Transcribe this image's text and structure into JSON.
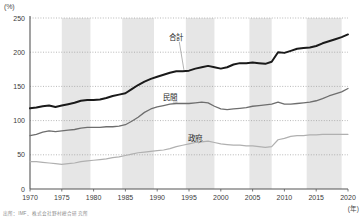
{
  "figure": {
    "y_unit_label": "(%)",
    "x_unit_label": "(年)",
    "source_note": "出所：IMF、株式会社野村総合研究所"
  },
  "chart_data": {
    "type": "line",
    "title": "",
    "subtitle": "",
    "xlabel": "(年)",
    "ylabel": "(%)",
    "xlim": [
      1970,
      2020
    ],
    "ylim": [
      0,
      250
    ],
    "yticks": [
      0,
      50,
      100,
      150,
      200,
      250
    ],
    "ytick_labels": [
      "0",
      "50",
      "100",
      "150",
      "200",
      "250"
    ],
    "xticks": [
      1970,
      1975,
      1980,
      1985,
      1990,
      1995,
      2000,
      2005,
      2010,
      2015,
      2020
    ],
    "xtick_labels": [
      "1970",
      "1975",
      "1980",
      "1985",
      "1990",
      "1995",
      "2000",
      "2005",
      "2010",
      "2015",
      "2020"
    ],
    "grid": "horizontal-dotted",
    "legend_position": "inline-annotations",
    "shaded_bands": [
      {
        "start": 1975.0,
        "end": 1979.5
      },
      {
        "start": 1984.5,
        "end": 1989.5
      },
      {
        "start": 1994.5,
        "end": 1999.0
      },
      {
        "start": 2004.5,
        "end": 2008.0
      },
      {
        "start": 2013.5,
        "end": 2019.0
      }
    ],
    "x": [
      1970,
      1971,
      1972,
      1973,
      1974,
      1975,
      1976,
      1977,
      1978,
      1979,
      1980,
      1981,
      1982,
      1983,
      1984,
      1985,
      1986,
      1987,
      1988,
      1989,
      1990,
      1991,
      1992,
      1993,
      1994,
      1995,
      1996,
      1997,
      1998,
      1999,
      2000,
      2001,
      2002,
      2003,
      2004,
      2005,
      2006,
      2007,
      2008,
      2009,
      2010,
      2011,
      2012,
      2013,
      2014,
      2015,
      2016,
      2017,
      2018,
      2019,
      2020
    ],
    "series": [
      {
        "name": "合計",
        "label": "合計",
        "color": "#1a1a1a",
        "width": 2.0,
        "label_x": 1993,
        "label_y": 218,
        "values": [
          118,
          119,
          121,
          122,
          120,
          122,
          124,
          126,
          129,
          130,
          130,
          131,
          133,
          136,
          138,
          140,
          146,
          152,
          157,
          161,
          164,
          167,
          170,
          172,
          172,
          173,
          176,
          178,
          180,
          178,
          176,
          178,
          182,
          184,
          184,
          185,
          184,
          183,
          186,
          200,
          199,
          202,
          205,
          206,
          207,
          209,
          213,
          216,
          219,
          222,
          226
        ]
      },
      {
        "name": "民間",
        "label": "民間",
        "color": "#6e6e6e",
        "width": 1.3,
        "label_x": 1992,
        "label_y": 130,
        "values": [
          78,
          80,
          83,
          85,
          84,
          85,
          86,
          87,
          89,
          90,
          90,
          90,
          91,
          91,
          92,
          94,
          99,
          105,
          112,
          117,
          120,
          122,
          124,
          125,
          125,
          125,
          126,
          127,
          126,
          121,
          117,
          116,
          117,
          118,
          119,
          121,
          122,
          123,
          124,
          127,
          124,
          124,
          125,
          126,
          127,
          129,
          132,
          136,
          139,
          142,
          147
        ]
      },
      {
        "name": "政府",
        "label": "政府",
        "color": "#b0b0b0",
        "width": 1.2,
        "label_x": 1996,
        "label_y": 70,
        "values": [
          40,
          40,
          39,
          38,
          37,
          36,
          37,
          38,
          40,
          41,
          42,
          43,
          44,
          46,
          47,
          49,
          51,
          53,
          54,
          55,
          56,
          57,
          59,
          62,
          64,
          66,
          68,
          69,
          70,
          68,
          66,
          65,
          64,
          64,
          63,
          63,
          62,
          61,
          62,
          72,
          74,
          77,
          78,
          78,
          79,
          79,
          80,
          80,
          80,
          80,
          80
        ]
      }
    ],
    "annotations": [
      {
        "text": "合計",
        "series": "合計"
      },
      {
        "text": "民間",
        "series": "民間"
      },
      {
        "text": "政府",
        "series": "政府"
      }
    ]
  }
}
